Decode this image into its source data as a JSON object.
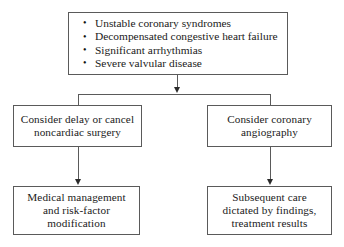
{
  "diagram": {
    "background_color": "#ffffff",
    "line_color": "#5a5a5a",
    "text_color": "#1a1a1a"
  },
  "top_box": {
    "bullets": [
      "Unstable coronary syndromes",
      "Decompensated congestive heart failure",
      "Significant arrhythmias",
      "Severe valvular disease"
    ]
  },
  "mid_left_box": {
    "lines": [
      "Consider delay or cancel",
      "noncardiac surgery"
    ]
  },
  "mid_right_box": {
    "lines": [
      "Consider coronary",
      "angiography"
    ]
  },
  "bottom_left_box": {
    "lines": [
      "Medical management",
      "and risk-factor",
      "modification"
    ]
  },
  "bottom_right_box": {
    "lines": [
      "Subsequent care",
      "dictated by findings,",
      "treatment results"
    ]
  }
}
